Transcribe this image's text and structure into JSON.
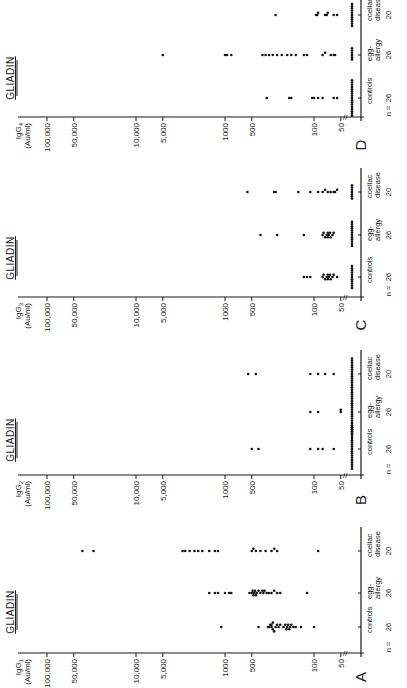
{
  "figure": {
    "rotation": "90deg counter-clockwise",
    "panels_order_bottom_to_top": [
      "A",
      "B",
      "C",
      "D"
    ]
  },
  "chart_data": [
    {
      "type": "scatter",
      "panel": "A",
      "title": "GLIADIN",
      "ylabel_line1": "IgG1",
      "ylabel_line2": "(Au/ml)",
      "yscale": "log",
      "ylim": [
        40,
        100000
      ],
      "yticks": [
        "100,000",
        "50,000",
        "10,000",
        "5,000",
        "1000",
        "500",
        "100",
        "50"
      ],
      "ytick_values": [
        100000,
        50000,
        10000,
        5000,
        1000,
        500,
        100,
        50
      ],
      "n_label": "n =",
      "categories": [
        {
          "name_line1": "controls",
          "name_line2": "",
          "n": "26"
        },
        {
          "name_line1": "egg-",
          "name_line2": "allergy",
          "n": "26"
        },
        {
          "name_line1": "coeliac",
          "name_line2": "disease",
          "n": "20"
        }
      ],
      "series": [
        {
          "name": "controls",
          "values": [
            1100,
            420,
            330,
            320,
            310,
            300,
            300,
            290,
            290,
            280,
            270,
            260,
            250,
            240,
            220,
            210,
            205,
            200,
            195,
            190,
            185,
            180,
            170,
            160,
            140,
            100
          ]
        },
        {
          "name": "egg-allergy",
          "values": [
            1500,
            1300,
            1200,
            1000,
            900,
            850,
            530,
            500,
            490,
            480,
            470,
            460,
            450,
            440,
            420,
            400,
            380,
            370,
            360,
            340,
            320,
            300,
            280,
            260,
            240,
            120
          ]
        },
        {
          "name": "coeliac disease",
          "values": [
            40000,
            30000,
            3000,
            2800,
            2500,
            2200,
            2000,
            1800,
            1500,
            1300,
            1200,
            500,
            480,
            450,
            400,
            350,
            300,
            280,
            260,
            90
          ]
        }
      ]
    },
    {
      "type": "scatter",
      "panel": "B",
      "title": "GLIADIN",
      "ylabel_line1": "IgG2",
      "ylabel_line2": "(Au/ml)",
      "yscale": "log",
      "ylim": [
        40,
        100000
      ],
      "yticks": [
        "100,000",
        "50,000",
        "10,000",
        "5,000",
        "1000",
        "500",
        "100",
        "50"
      ],
      "ytick_values": [
        100000,
        50000,
        10000,
        5000,
        1000,
        500,
        100,
        50
      ],
      "n_label": "n =",
      "categories": [
        {
          "name_line1": "controls",
          "name_line2": "",
          "n": "26"
        },
        {
          "name_line1": "egg-",
          "name_line2": "allergy",
          "n": "26"
        },
        {
          "name_line1": "coeliac",
          "name_line2": "disease",
          "n": "20"
        }
      ],
      "series": [
        {
          "name": "controls",
          "values": [
            500,
            420,
            110,
            90,
            80,
            60,
            40,
            40,
            40,
            40,
            40,
            40,
            40,
            40,
            40,
            40,
            40,
            40,
            40,
            40,
            40,
            40,
            40,
            40,
            40,
            40
          ]
        },
        {
          "name": "egg-allergy",
          "values": [
            110,
            90,
            50,
            50,
            45,
            40,
            40,
            40,
            40,
            40,
            40,
            40,
            40,
            40,
            40,
            40,
            40,
            40,
            40,
            40,
            40,
            40,
            40,
            40,
            40,
            40
          ]
        },
        {
          "name": "coeliac disease",
          "values": [
            550,
            450,
            110,
            90,
            75,
            60,
            40,
            40,
            40,
            40,
            40,
            40,
            40,
            40,
            40,
            40,
            40,
            40,
            40,
            40
          ]
        }
      ]
    },
    {
      "type": "scatter",
      "panel": "C",
      "title": "GLIADIN",
      "ylabel_line1": "IgG3",
      "ylabel_line2": "(Au/ml)",
      "yscale": "log",
      "ylim": [
        40,
        100000
      ],
      "yticks": [
        "100,000",
        "50,000",
        "10,000",
        "5,000",
        "1000",
        "500",
        "100",
        "50"
      ],
      "ytick_values": [
        100000,
        50000,
        10000,
        5000,
        1000,
        500,
        100,
        50
      ],
      "n_label": "n =",
      "categories": [
        {
          "name_line1": "controls",
          "name_line2": "",
          "n": "26"
        },
        {
          "name_line1": "egg-",
          "name_line2": "allergy",
          "n": "26"
        },
        {
          "name_line1": "coeliac",
          "name_line2": "disease",
          "n": "20"
        }
      ],
      "series": [
        {
          "name": "controls",
          "values": [
            130,
            120,
            110,
            80,
            78,
            75,
            72,
            70,
            70,
            68,
            66,
            65,
            62,
            60,
            55,
            40,
            40,
            40,
            40,
            40,
            40,
            40,
            40,
            40,
            40,
            40
          ]
        },
        {
          "name": "egg-allergy",
          "values": [
            400,
            260,
            130,
            80,
            78,
            75,
            72,
            70,
            70,
            68,
            66,
            65,
            62,
            60,
            40,
            40,
            40,
            40,
            40,
            40,
            40,
            40,
            40,
            40,
            40,
            40
          ]
        },
        {
          "name": "coeliac disease",
          "values": [
            560,
            280,
            270,
            150,
            110,
            90,
            80,
            75,
            70,
            65,
            60,
            58,
            55,
            40,
            40,
            40,
            40,
            40,
            40,
            40
          ]
        }
      ]
    },
    {
      "type": "scatter",
      "panel": "D",
      "title": "GLIADIN",
      "ylabel_line1": "IgG4",
      "ylabel_line2": "(Au/ml)",
      "yscale": "log",
      "ylim": [
        40,
        100000
      ],
      "yticks": [
        "100,000",
        "50,000",
        "10,000",
        "5,000",
        "1000",
        "500",
        "100",
        "50"
      ],
      "ytick_values": [
        100000,
        50000,
        10000,
        5000,
        1000,
        500,
        100,
        50
      ],
      "n_label": "n =",
      "categories": [
        {
          "name_line1": "controls",
          "name_line2": "",
          "n": "26"
        },
        {
          "name_line1": "egg-",
          "name_line2": "allergy",
          "n": "26"
        },
        {
          "name_line1": "coeliac",
          "name_line2": "disease",
          "n": "20"
        }
      ],
      "series": [
        {
          "name": "controls",
          "values": [
            340,
            190,
            180,
            105,
            100,
            90,
            80,
            60,
            55,
            40,
            40,
            40,
            40,
            40,
            40,
            40,
            40,
            40,
            40,
            40,
            40,
            40,
            40,
            40,
            40,
            40
          ]
        },
        {
          "name": "egg-allergy",
          "values": [
            5000,
            1000,
            950,
            850,
            380,
            350,
            320,
            290,
            260,
            230,
            200,
            180,
            160,
            130,
            120,
            80,
            75,
            65,
            60,
            58,
            40,
            40,
            40,
            40,
            40,
            40
          ]
        },
        {
          "name": "coeliac disease",
          "values": [
            270,
            95,
            92,
            90,
            75,
            72,
            70,
            60,
            55,
            40,
            40,
            40,
            40,
            40,
            40,
            40,
            40,
            40,
            40,
            40
          ]
        }
      ]
    }
  ],
  "labels": {
    "A": "A",
    "B": "B",
    "C": "C",
    "D": "D",
    "axis_break": "//"
  }
}
